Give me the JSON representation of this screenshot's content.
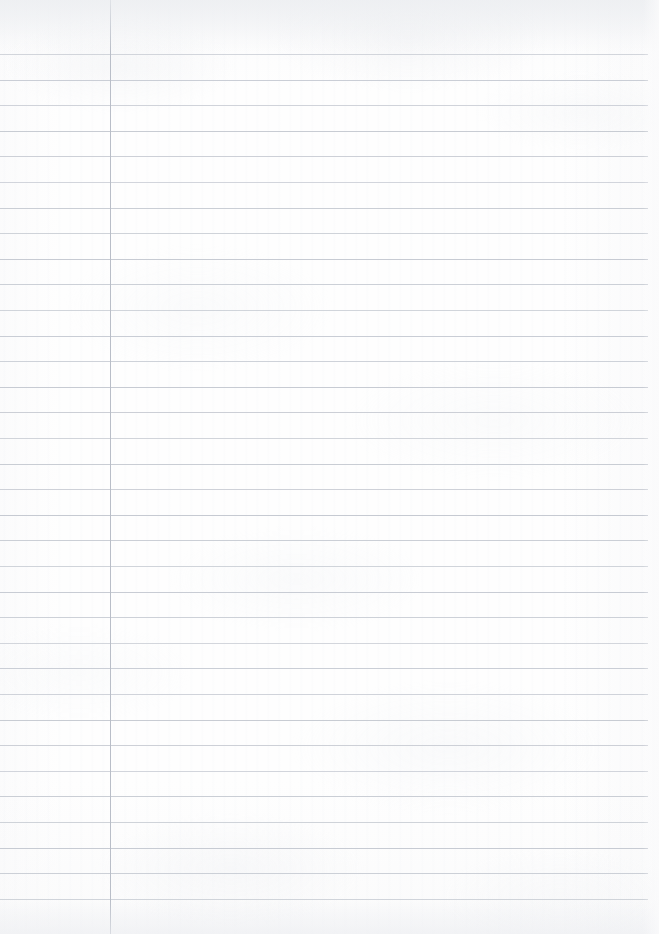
{
  "document": {
    "kind": "scanned-lined-notebook-page",
    "content_text": "",
    "handwriting_present": "no",
    "printed_text_present": "no"
  },
  "page": {
    "width": 659,
    "height": 934,
    "background_color": "#fefefe",
    "paper_tint": "#f7f8f9"
  },
  "ruling": {
    "style": "single-ruled",
    "rule_color": "#c6cad2",
    "rule_thickness": 1,
    "rule_count": 34,
    "first_rule_y": 54,
    "rule_spacing": 25.6,
    "rule_left_x": 0,
    "rule_right_x": 648,
    "rule_y_positions": [
      54,
      80,
      105,
      131,
      156,
      182,
      208,
      233,
      259,
      284,
      310,
      336,
      361,
      387,
      412,
      438,
      464,
      489,
      515,
      540,
      566,
      592,
      617,
      643,
      668,
      694,
      720,
      745,
      771,
      796,
      822,
      848,
      873,
      899
    ]
  },
  "margin": {
    "style": "vertical-margin-rule",
    "margin_color": "#b9bec8",
    "margin_thickness": 1,
    "margin_x": 110,
    "margin_top_y": 0,
    "margin_bottom_y": 934,
    "left_gutter_width": 110
  },
  "scan_artifacts": {
    "top_shadow": "#eceef1",
    "bottom_shadow": "#eeeff2",
    "right_edge_falloff": "#fafafb",
    "texture": "subtle-mottled-paper-grain"
  }
}
